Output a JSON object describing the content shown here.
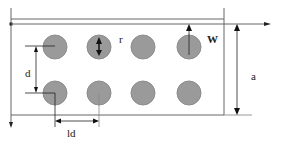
{
  "diagram": {
    "colors": {
      "line": "#555555",
      "hole_fill": "#9a9a9a",
      "hole_stroke": "#8a8a8a",
      "arrow": "#111111",
      "background": "#ffffff"
    },
    "holes": {
      "rows": 2,
      "cols": 4
    },
    "labels": {
      "radius": "r",
      "width": "W",
      "height": "a",
      "row_spacing": "d",
      "col_spacing": "ld"
    }
  }
}
